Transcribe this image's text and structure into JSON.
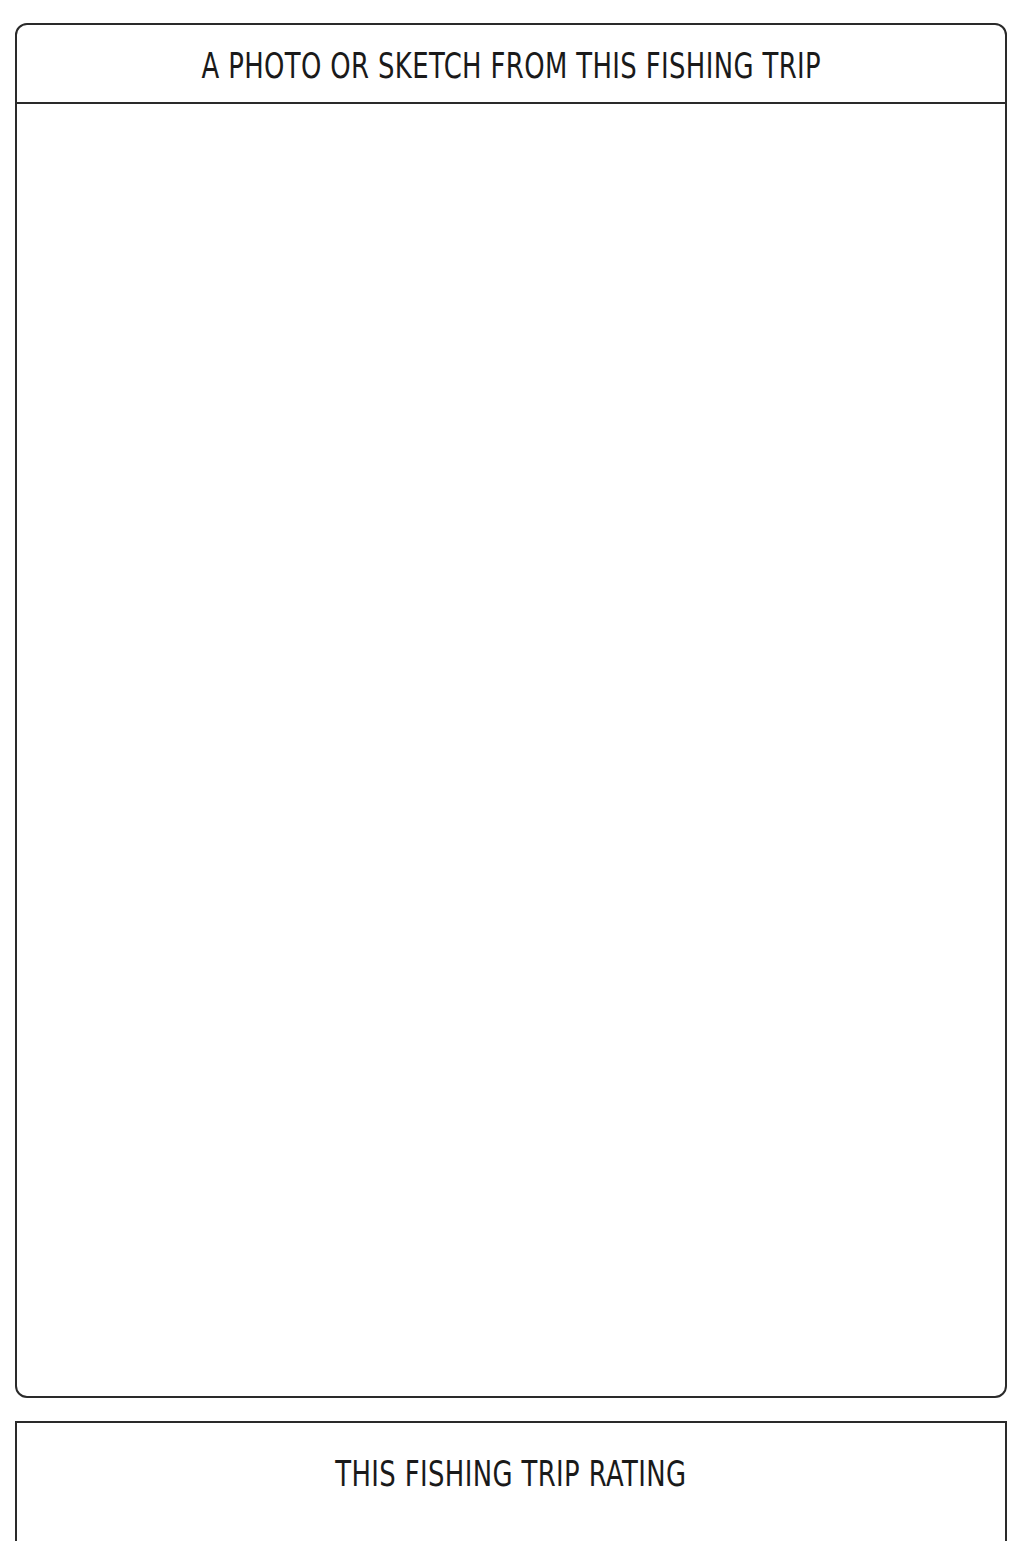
{
  "photo_section": {
    "title": "A PHOTO OR SKETCH FROM THIS FISHING TRIP",
    "content": ""
  },
  "rating_section": {
    "title": "THIS FISHING TRIP RATING"
  },
  "colors": {
    "border": "#2a2a2a",
    "text": "#1a1a1a",
    "background": "#ffffff"
  }
}
